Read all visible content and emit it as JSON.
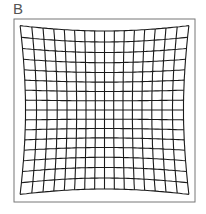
{
  "figure": {
    "panel_label": "B",
    "frame": {
      "x": 14,
      "y": 19,
      "width": 181,
      "height": 183,
      "stroke": "#777777"
    },
    "grid": {
      "center_x": 104.5,
      "center_y": 110,
      "lines_per_axis": 17,
      "spacing": 9.2,
      "distortion_k": 1.35e-05,
      "stroke": "#1a1a1a",
      "stroke_width": 1.1
    }
  }
}
